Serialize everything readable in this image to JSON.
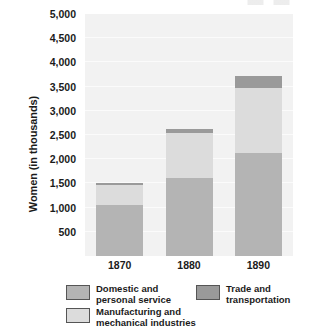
{
  "chart_data": {
    "type": "bar",
    "subtype": "stacked-bar",
    "title": "",
    "xlabel": "",
    "ylabel": "Women (in thousands)",
    "categories": [
      "1870",
      "1880",
      "1890"
    ],
    "series": [
      {
        "name": "Domestic and\npersonal service",
        "color": "#b4b4b4",
        "values": [
          1050,
          1620,
          2120
        ]
      },
      {
        "name": "Manufacturing and\nmechanical industries",
        "color": "#dcdcdc",
        "values": [
          420,
          920,
          1360
        ]
      },
      {
        "name": "Trade and\ntransportation",
        "color": "#9a9a9a",
        "values": [
          30,
          80,
          240
        ]
      }
    ],
    "totals": [
      1500,
      2620,
      3720
    ],
    "ylim": [
      0,
      5000
    ],
    "yticks": [
      500,
      1000,
      1500,
      2000,
      2500,
      3000,
      3500,
      4000,
      4500,
      5000
    ],
    "ytick_labels": [
      "500",
      "1,000",
      "1,500",
      "2,000",
      "2,500",
      "3,000",
      "3,500",
      "4,000",
      "4,500",
      "5,000"
    ],
    "grid": true,
    "legend_position": "bottom",
    "plot_background": "#f2f2f2"
  },
  "axes": {
    "y_title": "Women (in thousands)",
    "y_tick_labels": [
      "5,000",
      "4,500",
      "4,000",
      "3,500",
      "3,000",
      "2,500",
      "2,000",
      "1,500",
      "1,000",
      "500"
    ],
    "x_tick_labels": [
      "1870",
      "1880",
      "1890"
    ]
  },
  "legend": {
    "items": [
      {
        "label": "Domestic and\npersonal service",
        "color": "#b4b4b4"
      },
      {
        "label": "Trade and\ntransportation",
        "color": "#9a9a9a"
      },
      {
        "label": "Manufacturing and\nmechanical industries",
        "color": "#dcdcdc"
      }
    ]
  }
}
